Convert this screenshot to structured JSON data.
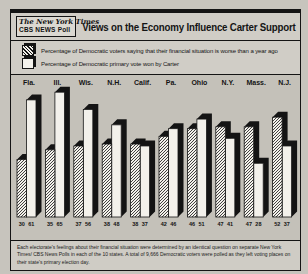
{
  "header": {
    "logo_line1": "The New York Times",
    "logo_line2": "CBS NEWS Poll",
    "title": "Views on the Economy Influence Carter Support"
  },
  "legend": {
    "items": [
      {
        "swatch": "hatched-bar-swatch",
        "label": "Percentage of Democratic voters saying that their financial situation is worse than a year ago"
      },
      {
        "swatch": "white-bar-swatch",
        "label": "Percentage of Democratic primary vote won by Carter"
      }
    ]
  },
  "chart_data": {
    "type": "bar",
    "title": "Views on the Economy Influence Carter Support",
    "categories": [
      "Fla.",
      "Ill.",
      "Wis.",
      "N.H.",
      "Calif.",
      "Pa.",
      "Ohio",
      "N.Y.",
      "Mass.",
      "N.J."
    ],
    "series": [
      {
        "name": "Percentage of Democratic voters saying that their financial situation is worse than a year ago",
        "style": "hatched",
        "values": [
          30,
          35,
          37,
          38,
          38,
          42,
          46,
          47,
          47,
          52
        ]
      },
      {
        "name": "Percentage of Democratic primary vote won by Carter",
        "style": "white",
        "values": [
          61,
          65,
          56,
          48,
          37,
          46,
          51,
          41,
          28,
          37
        ]
      }
    ],
    "value_labels_shown": true,
    "xlabel": "",
    "ylabel": "",
    "ylim": [
      0,
      70
    ],
    "grid": false,
    "legend_position": "top",
    "bar_style": "3d-extruded"
  },
  "footnote": "Each electorate's feelings about their financial situation were determined by an identical question on separate New York Times/ CBS News Polls in each of the 10 states. A total of 9,666 Democratic voters were polled as they left voting places on their state's primary election day.",
  "colors": {
    "paper": "#c7c4bd",
    "panel": "#c4c1b9",
    "ink": "#141414",
    "bar_white": "#f3f1eb"
  }
}
